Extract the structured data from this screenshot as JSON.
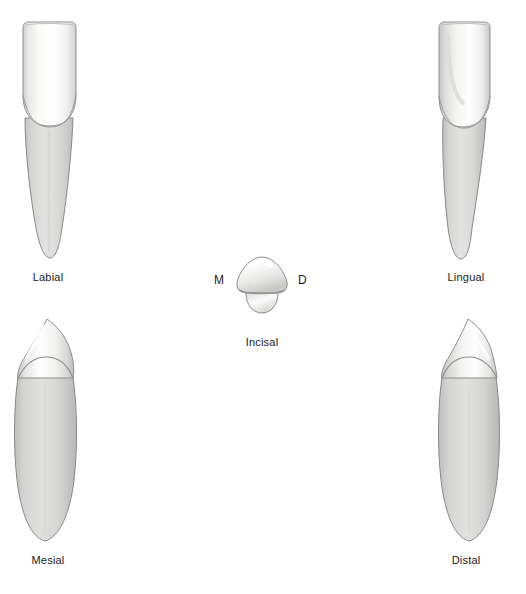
{
  "figure": {
    "background_color": "#ffffff",
    "outline_color": "#808080",
    "crown_color": "#fbfbfb",
    "root_color": "#d5d5d3",
    "label_color": "#1a1a1a"
  },
  "views": [
    {
      "id": "labial",
      "caption": "Labial",
      "caption_x": 48,
      "caption_y": 271
    },
    {
      "id": "lingual",
      "caption": "Lingual",
      "caption_x": 466,
      "caption_y": 271
    },
    {
      "id": "incisal",
      "caption": "Incisal",
      "caption_x": 262,
      "caption_y": 336
    },
    {
      "id": "mesial",
      "caption": "Mesial",
      "caption_x": 48,
      "caption_y": 554
    },
    {
      "id": "distal",
      "caption": "Distal",
      "caption_x": 466,
      "caption_y": 554
    }
  ],
  "incisal_markers": {
    "mesial_letter": "M",
    "mesial_x": 214,
    "mesial_y": 273,
    "distal_letter": "D",
    "distal_x": 298,
    "distal_y": 273
  }
}
